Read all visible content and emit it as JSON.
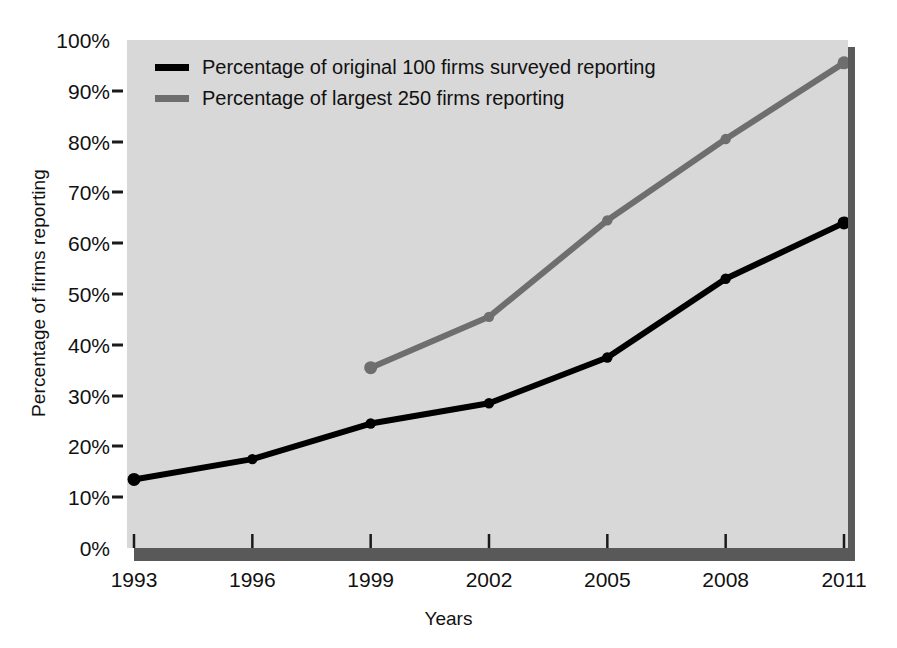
{
  "chart_data": {
    "type": "line",
    "title": "",
    "xlabel": "Years",
    "ylabel": "Percentage of firms reporting",
    "x": [
      1993,
      1996,
      1999,
      2002,
      2005,
      2008,
      2011
    ],
    "categories": [
      "1993",
      "1996",
      "1999",
      "2002",
      "2005",
      "2008",
      "2011"
    ],
    "xlim": [
      1993,
      2011
    ],
    "ylim": [
      0,
      100
    ],
    "y_ticks": [
      0,
      10,
      20,
      30,
      40,
      50,
      60,
      70,
      80,
      90,
      100
    ],
    "y_tick_labels": [
      "0%",
      "10%",
      "20%",
      "30%",
      "40%",
      "50%",
      "60%",
      "70%",
      "80%",
      "90%",
      "100%"
    ],
    "grid": false,
    "legend_position": "upper-left-inside",
    "series": [
      {
        "name": "Percentage of original 100 firms surveyed reporting",
        "color": "#000000",
        "x": [
          1993,
          1996,
          1999,
          2002,
          2005,
          2008,
          2011
        ],
        "values": [
          13.5,
          17.5,
          24.5,
          28.5,
          37.5,
          53.0,
          64.0
        ]
      },
      {
        "name": "Percentage of largest 250 firms reporting",
        "color": "#6e6e6e",
        "x": [
          1999,
          2002,
          2005,
          2008,
          2011
        ],
        "values": [
          35.5,
          45.5,
          64.5,
          80.5,
          95.5
        ]
      }
    ]
  },
  "axes": {
    "y_title": "Percentage of firms reporting",
    "x_title": "Years",
    "y_labels": [
      "100%",
      "90%",
      "80%",
      "70%",
      "60%",
      "50%",
      "40%",
      "30%",
      "20%",
      "10%",
      "0%"
    ],
    "x_labels": [
      "1993",
      "1996",
      "1999",
      "2002",
      "2005",
      "2008",
      "2011"
    ]
  },
  "legend": {
    "items": [
      {
        "label": "Percentage of original 100 firms surveyed reporting",
        "color": "#000000"
      },
      {
        "label": "Percentage of largest 250 firms reporting",
        "color": "#6e6e6e"
      }
    ]
  },
  "colors": {
    "plot_background": "#d8d8d8",
    "plot_shadow": "#595959",
    "page_background": "#ffffff",
    "series_1": "#000000",
    "series_2": "#6e6e6e",
    "text": "#111111"
  }
}
